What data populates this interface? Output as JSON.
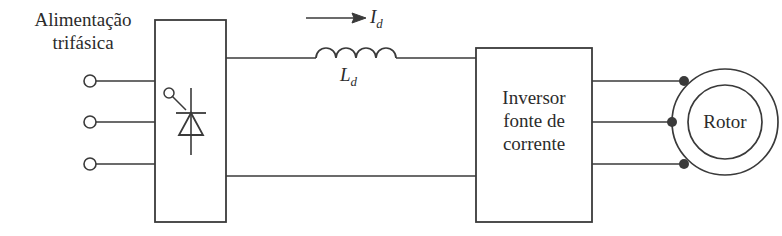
{
  "diagram": {
    "type": "block-diagram",
    "stroke_color": "#3a3a3a",
    "text_color": "#2b2b2b",
    "background_color": "#ffffff"
  },
  "supply": {
    "label": "Alimentação\ntrifásica",
    "terminal_count": 3,
    "terminals": [
      {
        "name": "phase-a",
        "cx": 90,
        "cy": 81
      },
      {
        "name": "phase-b",
        "cx": 90,
        "cy": 122
      },
      {
        "name": "phase-c",
        "cx": 90,
        "cy": 164
      }
    ]
  },
  "rectifier": {
    "name": "thyristor-rectifier",
    "symbol": "thyristor-icon",
    "x": 155,
    "y": 20,
    "width": 71,
    "height": 202
  },
  "dc_link": {
    "inductor_label": "L",
    "inductor_subscript": "d",
    "current_label": "I",
    "current_subscript": "d",
    "current_direction": "right",
    "coil_humps": 4,
    "top_line_y": 58,
    "bottom_line_y": 176
  },
  "inverter": {
    "label": "Inversor\nfonte de\ncorrente",
    "x": 476,
    "y": 48,
    "width": 116,
    "height": 174,
    "output_phases": 3
  },
  "rotor": {
    "label": "Rotor",
    "center_x": 725,
    "center_y": 122,
    "outer_radius": 53,
    "inner_radius": 37,
    "connection_points": [
      {
        "name": "rotor-terminal-a",
        "cx": 684,
        "cy": 81
      },
      {
        "name": "rotor-terminal-b",
        "cx": 672,
        "cy": 122
      },
      {
        "name": "rotor-terminal-c",
        "cx": 684,
        "cy": 164
      }
    ]
  }
}
